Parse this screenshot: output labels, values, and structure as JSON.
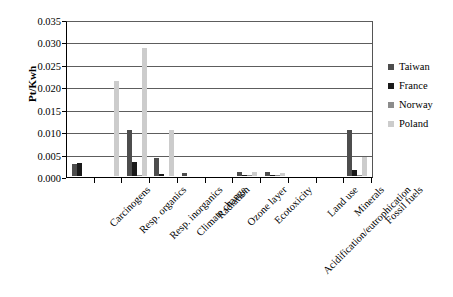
{
  "chart_data": {
    "type": "bar",
    "title": "",
    "xlabel": "",
    "ylabel": "Pt/Kwh",
    "ylim": [
      0,
      0.035
    ],
    "ytick_labels": [
      "0.000",
      "0.005",
      "0.010",
      "0.015",
      "0.020",
      "0.025",
      "0.030",
      "0.035"
    ],
    "ytick_values": [
      0,
      0.005,
      0.01,
      0.015,
      0.02,
      0.025,
      0.03,
      0.035
    ],
    "grid": true,
    "legend_position": "right",
    "categories": [
      "Carcinogens",
      "Resp. organics",
      "Resp. inorganics",
      "Climate change",
      "Radiation",
      "Ozone layer",
      "Ecotoxicity",
      "Acidification/eutrophication",
      "Land use",
      "Minerals",
      "Fossil fuels"
    ],
    "series": [
      {
        "name": "Taiwan",
        "color": "#4d4d4d",
        "values": [
          0.0027,
          0.0,
          0.0103,
          0.004,
          0.0007,
          0.0,
          0.0009,
          0.0008,
          0.0,
          0.0,
          0.0103
        ]
      },
      {
        "name": "France",
        "color": "#1a1a1a",
        "values": [
          0.0029,
          0.0,
          0.0032,
          0.0005,
          0.0,
          0.0,
          0.0001,
          0.0001,
          0.0,
          0.0,
          0.0013
        ]
      },
      {
        "name": "Norway",
        "color": "#8c8c8c",
        "values": [
          0.0,
          0.0,
          0.0003,
          0.0,
          0.0,
          0.0,
          0.0001,
          0.0001,
          0.0,
          0.0,
          0.0002
        ]
      },
      {
        "name": "Poland",
        "color": "#cccccc",
        "values": [
          0.0,
          0.0212,
          0.0285,
          0.0103,
          0.0,
          0.0,
          0.001,
          0.0006,
          0.0,
          0.0,
          0.0043
        ]
      }
    ]
  },
  "legend": {
    "items": [
      {
        "label": "Taiwan",
        "color": "#4d4d4d"
      },
      {
        "label": "France",
        "color": "#1a1a1a"
      },
      {
        "label": "Norway",
        "color": "#8c8c8c"
      },
      {
        "label": "Poland",
        "color": "#cccccc"
      }
    ]
  }
}
